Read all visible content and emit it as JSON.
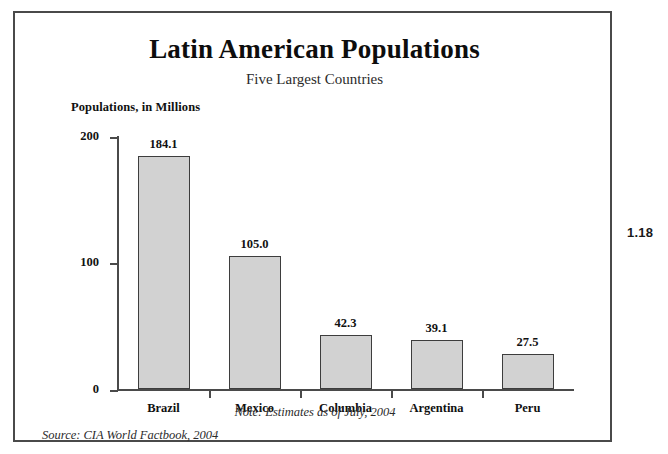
{
  "figure_number": "1.18",
  "chart_data": {
    "type": "bar",
    "title": "Latin American Populations",
    "subtitle": "Five Largest Countries",
    "ylabel": "Populations, in Millions",
    "xlabel": "",
    "categories": [
      "Brazil",
      "Mexico",
      "Columbia",
      "Argentina",
      "Peru"
    ],
    "values": [
      184.1,
      105.0,
      42.3,
      39.1,
      27.5
    ],
    "value_labels": [
      "184.1",
      "105.0",
      "42.3",
      "39.1",
      "27.5"
    ],
    "ylim": [
      0,
      200
    ],
    "yticks": [
      0,
      100,
      200
    ],
    "ytick_labels": [
      "0",
      "100",
      "200"
    ],
    "grid": false,
    "legend": false,
    "bar_color": "#d2d2d2",
    "bar_edge_color": "#3d3d3d",
    "axis_color": "#4a4a4a",
    "note": "Note: Estimates as of July, 2004",
    "source": "Source: CIA World Factbook, 2004"
  }
}
